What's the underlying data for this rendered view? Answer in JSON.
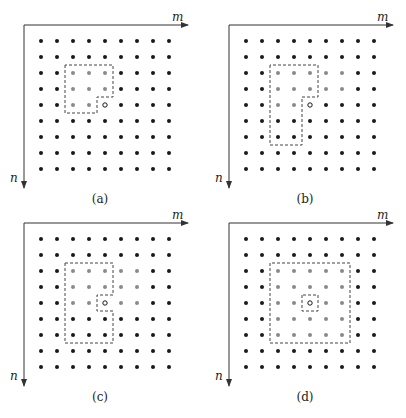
{
  "figure": {
    "grid_size": 9,
    "spacing": 16,
    "colors": {
      "black_dot": "#1a1a1a",
      "gray_dot": "#8a8a8a",
      "open_circle_stroke": "#1a1a1a",
      "axis": "#333333",
      "dashed_box": "#444444"
    },
    "axis_labels": {
      "horizontal": "m",
      "vertical": "n"
    },
    "panels": [
      {
        "id": "a",
        "caption": "(a)",
        "origin": [
          24,
          25
        ],
        "current_pixel": [
          4,
          4
        ],
        "gray_pixels": [
          [
            2,
            2
          ],
          [
            2,
            3
          ],
          [
            2,
            4
          ],
          [
            3,
            2
          ],
          [
            3,
            3
          ],
          [
            3,
            4
          ],
          [
            4,
            2
          ],
          [
            4,
            3
          ]
        ],
        "region_outline": [
          [
            1.5,
            1.5
          ],
          [
            4.5,
            1.5
          ],
          [
            4.5,
            3.5
          ],
          [
            3.5,
            3.5
          ],
          [
            3.5,
            4.5
          ],
          [
            1.5,
            4.5
          ]
        ],
        "inner_box": null
      },
      {
        "id": "b",
        "caption": "(b)",
        "origin": [
          229,
          25
        ],
        "current_pixel": [
          4,
          4
        ],
        "gray_pixels": [
          [
            2,
            2
          ],
          [
            2,
            3
          ],
          [
            2,
            4
          ],
          [
            2,
            5
          ],
          [
            2,
            6
          ],
          [
            3,
            2
          ],
          [
            3,
            3
          ],
          [
            3,
            4
          ],
          [
            3,
            5
          ],
          [
            3,
            6
          ],
          [
            4,
            2
          ],
          [
            4,
            3
          ]
        ],
        "region_outline": [
          [
            1.5,
            1.5
          ],
          [
            6.5,
            1.5
          ],
          [
            6.5,
            3.5
          ],
          [
            3.5,
            3.5
          ],
          [
            3.5,
            4.5
          ],
          [
            1.5,
            4.5
          ]
        ],
        "inner_box": null
      },
      {
        "id": "c",
        "caption": "(c)",
        "origin": [
          24,
          223
        ],
        "current_pixel": [
          4,
          4
        ],
        "gray_pixels": [
          [
            2,
            2
          ],
          [
            2,
            3
          ],
          [
            2,
            4
          ],
          [
            2,
            5
          ],
          [
            2,
            6
          ],
          [
            3,
            2
          ],
          [
            3,
            3
          ],
          [
            3,
            4
          ],
          [
            3,
            5
          ],
          [
            3,
            6
          ],
          [
            4,
            2
          ],
          [
            4,
            3
          ],
          [
            4,
            5
          ],
          [
            4,
            6
          ]
        ],
        "region_outline": [
          [
            1.5,
            1.5
          ],
          [
            6.5,
            1.5
          ],
          [
            6.5,
            4.5
          ],
          [
            4.5,
            4.5
          ],
          [
            4.5,
            3.5
          ],
          [
            3.5,
            3.5
          ],
          [
            3.5,
            4.5
          ],
          [
            1.5,
            4.5
          ]
        ],
        "inner_box": null
      },
      {
        "id": "d",
        "caption": "(d)",
        "origin": [
          229,
          223
        ],
        "current_pixel": [
          4,
          4
        ],
        "gray_pixels": [
          [
            2,
            2
          ],
          [
            2,
            3
          ],
          [
            2,
            4
          ],
          [
            2,
            5
          ],
          [
            2,
            6
          ],
          [
            3,
            2
          ],
          [
            3,
            3
          ],
          [
            3,
            4
          ],
          [
            3,
            5
          ],
          [
            3,
            6
          ],
          [
            4,
            2
          ],
          [
            4,
            3
          ],
          [
            4,
            5
          ],
          [
            4,
            6
          ],
          [
            5,
            2
          ],
          [
            5,
            3
          ],
          [
            5,
            4
          ],
          [
            5,
            5
          ],
          [
            5,
            6
          ],
          [
            6,
            2
          ],
          [
            6,
            3
          ],
          [
            6,
            4
          ],
          [
            6,
            5
          ],
          [
            6,
            6
          ]
        ],
        "region_outline": [
          [
            1.5,
            1.5
          ],
          [
            6.5,
            1.5
          ],
          [
            6.5,
            6.5
          ],
          [
            1.5,
            6.5
          ]
        ],
        "inner_box": [
          [
            3.5,
            3.5
          ],
          [
            4.5,
            3.5
          ],
          [
            4.5,
            4.5
          ],
          [
            3.5,
            4.5
          ]
        ]
      }
    ]
  }
}
